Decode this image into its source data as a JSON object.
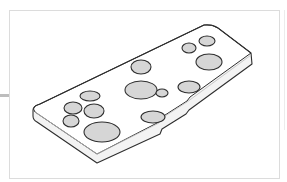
{
  "figure": {
    "type": "line-art illustration",
    "colors": {
      "background": "#ffffff",
      "frame_border": "#dcdcdc",
      "plate_fill": "#ffffff",
      "plate_side_fill": "#f3f3f3",
      "outline": "#2e2e2e",
      "blob_fill": "#d6d6d6",
      "left_tick": "#bdbdbd"
    },
    "blobs": [
      {
        "cx": 90,
        "cy": 96,
        "rx": 10,
        "ry": 5
      },
      {
        "cx": 73,
        "cy": 108,
        "rx": 9,
        "ry": 6
      },
      {
        "cx": 94,
        "cy": 111,
        "rx": 10,
        "ry": 7
      },
      {
        "cx": 71,
        "cy": 121,
        "rx": 8,
        "ry": 6
      },
      {
        "cx": 102,
        "cy": 132,
        "rx": 18,
        "ry": 10
      },
      {
        "cx": 141,
        "cy": 67,
        "rx": 10,
        "ry": 7
      },
      {
        "cx": 141,
        "cy": 90,
        "rx": 16,
        "ry": 9
      },
      {
        "cx": 162,
        "cy": 93,
        "rx": 6,
        "ry": 4
      },
      {
        "cx": 189,
        "cy": 87,
        "rx": 11,
        "ry": 6
      },
      {
        "cx": 153,
        "cy": 117,
        "rx": 12,
        "ry": 6
      },
      {
        "cx": 189,
        "cy": 48,
        "rx": 7,
        "ry": 5
      },
      {
        "cx": 207,
        "cy": 41,
        "rx": 8,
        "ry": 5
      },
      {
        "cx": 209,
        "cy": 62,
        "rx": 13,
        "ry": 8
      }
    ]
  }
}
